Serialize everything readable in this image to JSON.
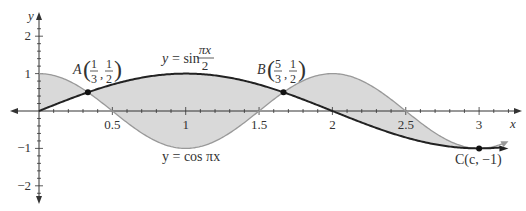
{
  "chart_data": {
    "type": "line",
    "title": "",
    "xlabel": "x",
    "ylabel": "y",
    "xlim": [
      0,
      3.2
    ],
    "ylim": [
      -2.3,
      2.3
    ],
    "x_ticks": [
      "0.5",
      "1",
      "1.5",
      "2",
      "2.5",
      "3"
    ],
    "y_ticks": [
      "2",
      "1",
      "-1",
      "-2"
    ],
    "series": [
      {
        "name": "y = sin(πx/2)",
        "label_text": "y = sin",
        "frac_num": "πx",
        "frac_den": "2",
        "color": "#222222",
        "style": "thick"
      },
      {
        "name": "y = cos πx",
        "label_text": "y = cos πx",
        "color": "#999999",
        "style": "thin"
      }
    ],
    "shaded_region": {
      "between": [
        "sin(πx/2)",
        "cos πx"
      ],
      "from": 0,
      "to": 3,
      "color": "#d9d9d9"
    },
    "points": [
      {
        "name": "A",
        "x": 0.3333,
        "y": 0.5,
        "frac_x_num": "1",
        "frac_x_den": "3",
        "frac_y_num": "1",
        "frac_y_den": "2"
      },
      {
        "name": "B",
        "x": 1.6667,
        "y": 0.5,
        "frac_x_num": "5",
        "frac_x_den": "3",
        "frac_y_num": "1",
        "frac_y_den": "2"
      },
      {
        "name": "C",
        "x": 3,
        "y": -1,
        "label": "C(c, −1)"
      }
    ],
    "grid": false
  }
}
